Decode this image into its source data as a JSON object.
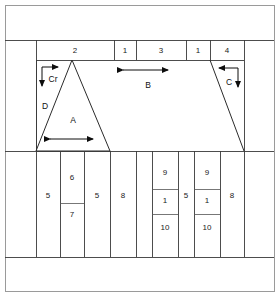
{
  "figure": {
    "frame": {
      "border_color": "#9a9a9a",
      "line_color": "#3a3a3a",
      "background": "#ffffff"
    },
    "caption": ""
  },
  "top_row": {
    "name": "top-dimension-row",
    "cells": [
      {
        "id": "t1",
        "label": "2"
      },
      {
        "id": "t2",
        "label": "1"
      },
      {
        "id": "t3",
        "label": "3"
      },
      {
        "id": "t4",
        "label": "1"
      },
      {
        "id": "t5",
        "label": "4"
      }
    ]
  },
  "middle_row": {
    "name": "middle-shape-row",
    "annotations": [
      {
        "id": "m-cr",
        "label": "Cr",
        "kind": "corner-arrow-left"
      },
      {
        "id": "m-d",
        "label": "D",
        "kind": "edge-label-left"
      },
      {
        "id": "m-a",
        "label": "A",
        "kind": "triangle-label"
      },
      {
        "id": "m-b",
        "label": "B",
        "kind": "span-arrow"
      },
      {
        "id": "m-c",
        "label": "C",
        "kind": "corner-arrow-right"
      }
    ]
  },
  "bottom_row": {
    "name": "bottom-dimension-row",
    "cells": [
      {
        "id": "b1",
        "label": "5"
      },
      {
        "id": "b2",
        "label": "6"
      },
      {
        "id": "b3",
        "label": "7"
      },
      {
        "id": "b4",
        "label": "5"
      },
      {
        "id": "b5",
        "label": "8"
      },
      {
        "id": "b6",
        "label": "9"
      },
      {
        "id": "b7",
        "label": "1"
      },
      {
        "id": "b8",
        "label": "10"
      },
      {
        "id": "b9",
        "label": "5"
      },
      {
        "id": "b10",
        "label": "9"
      },
      {
        "id": "b11",
        "label": "1"
      },
      {
        "id": "b12",
        "label": "10"
      },
      {
        "id": "b13",
        "label": "8"
      }
    ]
  }
}
